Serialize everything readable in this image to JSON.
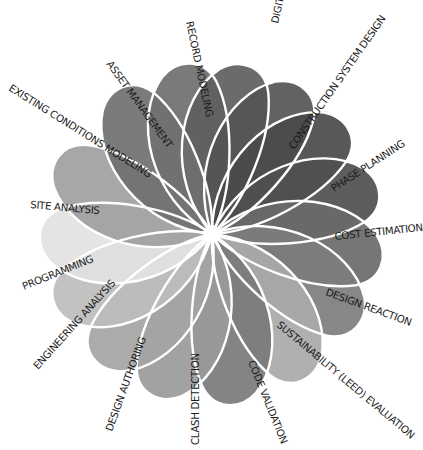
{
  "diagram": {
    "title": "",
    "center": {
      "x": 212,
      "y": 234
    },
    "petals": [
      {
        "label": "RECORD MODELING",
        "angle": -98,
        "color": "#6f6f6f",
        "label_pos": {
          "x": 186,
          "y": 22,
          "rot": 78
        }
      },
      {
        "label": "DIGITAL FABRICATION",
        "angle": -78,
        "color": "#5e5e5e",
        "label_pos": {
          "x": 278,
          "y": 24,
          "rot": -77
        }
      },
      {
        "label": "CONSTRUCTION SYSTEM DESIGN",
        "angle": -58,
        "color": "#555555",
        "label_pos": {
          "x": 294,
          "y": 150,
          "rot": -55
        }
      },
      {
        "label": "PHASE PLANNING",
        "angle": -38,
        "color": "#4a4a4a",
        "label_pos": {
          "x": 334,
          "y": 192,
          "rot": -33
        }
      },
      {
        "label": "COST ESTIMATION",
        "angle": -14,
        "color": "#4f4f4f",
        "label_pos": {
          "x": 335,
          "y": 240,
          "rot": -6
        }
      },
      {
        "label": "DESIGN REACTION",
        "angle": 10,
        "color": "#6a6a6a",
        "label_pos": {
          "x": 325,
          "y": 295,
          "rot": 20
        }
      },
      {
        "label": "SUSTAINABILITY (LEED) EVALUATION",
        "angle": 32,
        "color": "#7d7d7d",
        "label_pos": {
          "x": 276,
          "y": 326,
          "rot": 40
        }
      },
      {
        "label": "CODE VALIDATION",
        "angle": 58,
        "color": "#a9a9a9",
        "label_pos": {
          "x": 248,
          "y": 362,
          "rot": 68
        }
      },
      {
        "label": "CLASH DETECTION",
        "angle": 84,
        "color": "#7a7a7a",
        "label_pos": {
          "x": 199,
          "y": 445,
          "rot": -90
        }
      },
      {
        "label": "DESIGN AUTHORING",
        "angle": 110,
        "color": "#9a9a9a",
        "label_pos": {
          "x": 112,
          "y": 432,
          "rot": -70
        }
      },
      {
        "label": "ENGINEERING ANALYSIS",
        "angle": 133,
        "color": "#a4a4a4",
        "label_pos": {
          "x": 38,
          "y": 370,
          "rot": -48
        }
      },
      {
        "label": "PROGRAMMING",
        "angle": 157,
        "color": "#bdbdbd",
        "label_pos": {
          "x": 24,
          "y": 290,
          "rot": -22
        }
      },
      {
        "label": "SITE ANALYSIS",
        "angle": 180,
        "color": "#e2e2e2",
        "label_pos": {
          "x": 30,
          "y": 208,
          "rot": 5
        }
      },
      {
        "label": "EXISTING CONDITIONS MODELING",
        "angle": -154,
        "color": "#a0a0a0",
        "label_pos": {
          "x": 8,
          "y": 90,
          "rot": 32
        }
      },
      {
        "label": "ASSET MANAGEMENT",
        "angle": -122,
        "color": "#707070",
        "label_pos": {
          "x": 106,
          "y": 64,
          "rot": 54
        }
      }
    ]
  }
}
